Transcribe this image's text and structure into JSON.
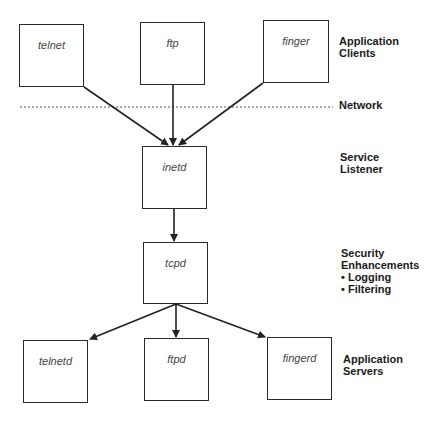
{
  "diagram": {
    "nodes": {
      "telnet": "telnet",
      "ftp": "ftp",
      "finger": "finger",
      "inetd": "inetd",
      "tcpd": "tcpd",
      "telnetd": "telnetd",
      "ftpd": "ftpd",
      "fingerd": "fingerd"
    },
    "layers": {
      "clients": [
        "Application",
        "Clients"
      ],
      "network": "Network",
      "listener": [
        "Service",
        "Listener"
      ],
      "security": [
        "Security",
        "Enhancements"
      ],
      "security_items": [
        "• Logging",
        "• Filtering"
      ],
      "servers": [
        "Application",
        "Servers"
      ]
    },
    "edges": [
      [
        "telnet",
        "inetd"
      ],
      [
        "ftp",
        "inetd"
      ],
      [
        "finger",
        "inetd"
      ],
      [
        "inetd",
        "tcpd"
      ],
      [
        "tcpd",
        "telnetd"
      ],
      [
        "tcpd",
        "ftpd"
      ],
      [
        "tcpd",
        "fingerd"
      ]
    ]
  }
}
